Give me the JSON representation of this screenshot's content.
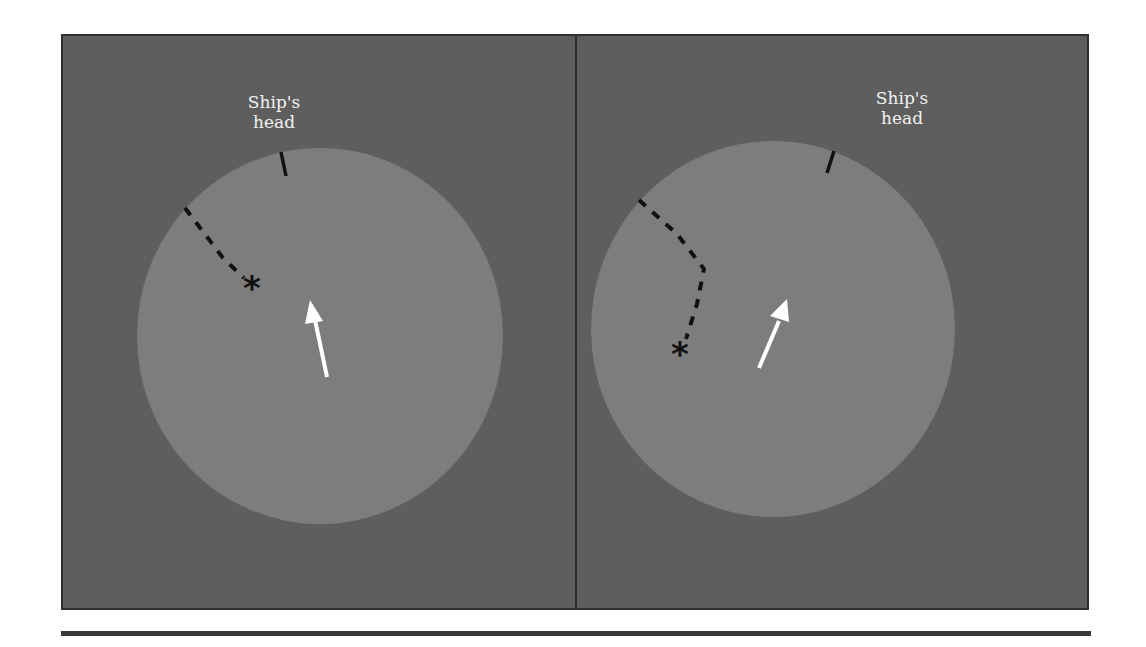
{
  "figure": {
    "colors": {
      "background": "#5e5e5e",
      "disc": "#7d7d7d",
      "border": "#2e2e2e",
      "heading_marker": "#111111",
      "track": "#111111",
      "arrow": "#ffffff",
      "label": "#f2f2f2"
    },
    "panels": [
      {
        "id": "left",
        "label_line1": "Ship's",
        "label_line2": "head",
        "icons": [
          "heading-marker",
          "dashed-track-straight",
          "target-asterisk",
          "white-arrow"
        ],
        "target_symbol": "*"
      },
      {
        "id": "right",
        "label_line1": "Ship's",
        "label_line2": "head",
        "icons": [
          "heading-marker",
          "dashed-track-curved",
          "target-asterisk",
          "white-arrow"
        ],
        "target_symbol": "*"
      }
    ]
  }
}
